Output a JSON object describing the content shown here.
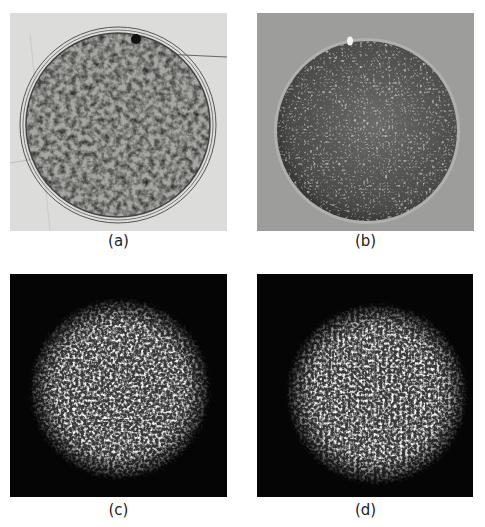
{
  "figure": {
    "panels": [
      {
        "id": "a",
        "label": "(a)",
        "description": "Bright-field micrograph of a circular droplet with mottled granular interior and concentric ring boundaries",
        "background": "#d8d8d6"
      },
      {
        "id": "b",
        "label": "(b)",
        "description": "Grey micrograph of a dome-shaped sphere covered in densely packed small bumps with a small bright speck near top",
        "background": "#9a9a98"
      },
      {
        "id": "c",
        "label": "(c)",
        "description": "Dark-field speckle image of a bright granular circular disk on black background",
        "background": "#050505"
      },
      {
        "id": "d",
        "label": "(d)",
        "description": "Dark-field speckle image of a bright granular circular disk with faint vertical line, on black background",
        "background": "#050505"
      }
    ]
  }
}
